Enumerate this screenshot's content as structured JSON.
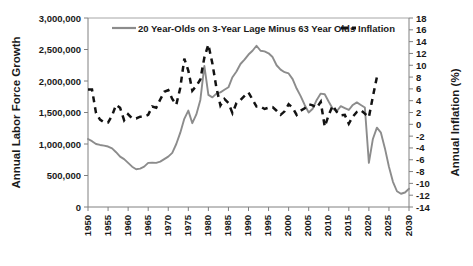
{
  "chart_data": {
    "type": "line",
    "title": "",
    "xlabel": "",
    "ylabel": "Annual Labor Force Growth",
    "y2label": "Annual Inflation (%)",
    "grid": false,
    "legend_position": "top-inside",
    "xlim": [
      1950,
      2030
    ],
    "ylim": [
      0,
      3000000
    ],
    "y2lim": [
      -14,
      18
    ],
    "x_ticks": [
      1950,
      1955,
      1960,
      1965,
      1970,
      1975,
      1980,
      1985,
      1990,
      1995,
      2000,
      2005,
      2010,
      2015,
      2020,
      2025,
      2030
    ],
    "x_tick_labels": [
      "1950",
      "1955",
      "1960",
      "1965",
      "1970",
      "1975",
      "1980",
      "1985",
      "1990",
      "1995",
      "2000",
      "2005",
      "2010",
      "2015",
      "2020",
      "2025",
      "2030"
    ],
    "y_ticks": [
      0,
      500000,
      1000000,
      1500000,
      2000000,
      2500000,
      3000000
    ],
    "y_tick_labels": [
      "0",
      "500,000",
      "1,000,000",
      "1,500,000",
      "2,000,000",
      "2,500,000",
      "3,000,000"
    ],
    "y2_ticks": [
      -14,
      -12,
      -10,
      -8,
      -6,
      -4,
      -2,
      0,
      2,
      4,
      6,
      8,
      10,
      12,
      14,
      16,
      18
    ],
    "y2_tick_labels": [
      "-14",
      "-12",
      "-10",
      "-8",
      "-6",
      "-4",
      "-2",
      "0",
      "2",
      "4",
      "6",
      "8",
      "10",
      "12",
      "14",
      "16",
      "18"
    ],
    "series": [
      {
        "name": "20 Year-Olds on 3-Year Lage Minus 63 Year Olds",
        "axis": "left",
        "color": "#8c8c8c",
        "style": "solid",
        "x": [
          1950,
          1951,
          1952,
          1953,
          1954,
          1955,
          1956,
          1957,
          1958,
          1959,
          1960,
          1961,
          1962,
          1963,
          1964,
          1965,
          1966,
          1967,
          1968,
          1969,
          1970,
          1971,
          1972,
          1973,
          1974,
          1975,
          1976,
          1977,
          1978,
          1979,
          1980,
          1981,
          1982,
          1983,
          1984,
          1985,
          1986,
          1987,
          1988,
          1989,
          1990,
          1991,
          1992,
          1993,
          1994,
          1995,
          1996,
          1997,
          1998,
          1999,
          2000,
          2001,
          2002,
          2003,
          2004,
          2005,
          2006,
          2007,
          2008,
          2009,
          2010,
          2011,
          2012,
          2013,
          2014,
          2015,
          2016,
          2017,
          2018,
          2019,
          2020,
          2021,
          2022,
          2023,
          2024,
          2025,
          2026,
          2027,
          2028,
          2029,
          2030
        ],
        "y": [
          1080000,
          1045000,
          1000000,
          985000,
          975000,
          960000,
          930000,
          870000,
          800000,
          760000,
          700000,
          640000,
          600000,
          610000,
          640000,
          700000,
          705000,
          700000,
          720000,
          760000,
          800000,
          860000,
          1000000,
          1180000,
          1400000,
          1530000,
          1330000,
          1470000,
          1700000,
          2240000,
          1780000,
          1740000,
          1800000,
          1820000,
          1860000,
          1900000,
          2060000,
          2150000,
          2270000,
          2340000,
          2420000,
          2480000,
          2560000,
          2480000,
          2470000,
          2440000,
          2380000,
          2250000,
          2180000,
          2140000,
          2120000,
          2030000,
          1880000,
          1760000,
          1620000,
          1500000,
          1560000,
          1700000,
          1800000,
          1790000,
          1670000,
          1560000,
          1520000,
          1600000,
          1570000,
          1540000,
          1620000,
          1660000,
          1620000,
          1580000,
          700000,
          1080000,
          1260000,
          1180000,
          930000,
          640000,
          400000,
          250000,
          210000,
          230000,
          290000
        ]
      },
      {
        "name": "Inflation",
        "axis": "right",
        "color": "#121212",
        "style": "dashed",
        "x": [
          1950,
          1951,
          1952,
          1953,
          1954,
          1955,
          1956,
          1957,
          1958,
          1959,
          1960,
          1961,
          1962,
          1963,
          1964,
          1965,
          1966,
          1967,
          1968,
          1969,
          1970,
          1971,
          1972,
          1973,
          1974,
          1975,
          1976,
          1977,
          1978,
          1979,
          1980,
          1981,
          1982,
          1983,
          1984,
          1985,
          1986,
          1987,
          1988,
          1989,
          1990,
          1991,
          1992,
          1993,
          1994,
          1995,
          1996,
          1997,
          1998,
          1999,
          2000,
          2001,
          2002,
          2003,
          2004,
          2005,
          2006,
          2007,
          2008,
          2009,
          2010,
          2011,
          2012,
          2013,
          2014,
          2015,
          2016,
          2017,
          2018,
          2019,
          2020,
          2021,
          2022
        ],
        "y": [
          5.9,
          5.9,
          1.9,
          0.8,
          0.3,
          0.3,
          1.5,
          3.3,
          2.8,
          0.7,
          1.7,
          1.0,
          1.0,
          1.3,
          1.3,
          1.6,
          3.0,
          2.8,
          4.2,
          5.5,
          5.8,
          4.3,
          3.3,
          6.2,
          11.1,
          9.1,
          5.7,
          6.5,
          7.6,
          11.3,
          13.5,
          10.3,
          6.2,
          3.2,
          4.3,
          3.6,
          1.9,
          3.6,
          4.1,
          4.8,
          5.4,
          4.2,
          3.0,
          3.0,
          2.6,
          2.8,
          2.9,
          2.3,
          1.6,
          2.2,
          3.4,
          2.8,
          1.6,
          2.3,
          2.7,
          3.4,
          3.2,
          2.8,
          3.8,
          -0.4,
          1.6,
          3.2,
          2.1,
          1.5,
          1.6,
          0.1,
          1.3,
          2.1,
          2.4,
          1.8,
          1.2,
          4.7,
          8.0
        ]
      }
    ]
  },
  "legend": {
    "items": [
      {
        "label": "20 Year-Olds on 3-Year Lage Minus 63 Year Olds",
        "marker": "solid-line",
        "color": "#8c8c8c"
      },
      {
        "label": "Inflation",
        "marker": "dashed-line",
        "color": "#121212"
      }
    ]
  },
  "axes": {
    "left_title": "Annual Labor Force Growth",
    "right_title": "Annual Inflation (%)"
  }
}
